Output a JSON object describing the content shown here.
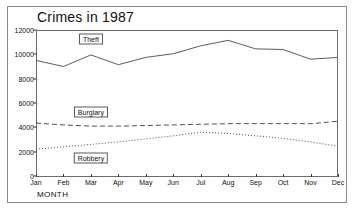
{
  "window": {
    "has_border": true
  },
  "chart_data": {
    "type": "line",
    "title": "Crimes in 1987",
    "xlabel": "MONTH",
    "ylabel": "",
    "categories": [
      "Jan",
      "Feb",
      "Mar",
      "Apr",
      "May",
      "Jun",
      "Jul",
      "Aug",
      "Sep",
      "Oct",
      "Nov",
      "Dec"
    ],
    "x_tick_labels": [
      "Jan",
      "Feb",
      "Mar",
      "Apr",
      "May",
      "Jun",
      "Jul",
      "Aug",
      "Sep",
      "Oct",
      "Nov",
      "Dec"
    ],
    "y_tick_labels": [
      "0",
      "2000",
      "4000",
      "6000",
      "8000",
      "10000",
      "12000"
    ],
    "y_ticks": [
      0,
      2000,
      4000,
      6000,
      8000,
      10000,
      12000
    ],
    "ylim": [
      0,
      12000
    ],
    "grid": false,
    "legend_position": "inline-labels",
    "series": [
      {
        "name": "Theft",
        "style": "solid",
        "color": "#4a4a4a",
        "label_at_month": "Mar",
        "values": [
          9500,
          9000,
          9950,
          9150,
          9750,
          10050,
          10700,
          11150,
          10450,
          10400,
          9600,
          9750
        ]
      },
      {
        "name": "Burglary",
        "style": "dashed",
        "color": "#3a3a3a",
        "label_at_month": "Mar",
        "values": [
          4350,
          4200,
          4100,
          4100,
          4150,
          4200,
          4250,
          4300,
          4300,
          4300,
          4300,
          4500
        ]
      },
      {
        "name": "Robbery",
        "style": "dotted",
        "color": "#3a3a3a",
        "label_at_month": "Mar",
        "values": [
          2200,
          2400,
          2600,
          2800,
          3050,
          3300,
          3600,
          3500,
          3300,
          3100,
          2800,
          2450
        ]
      }
    ]
  }
}
